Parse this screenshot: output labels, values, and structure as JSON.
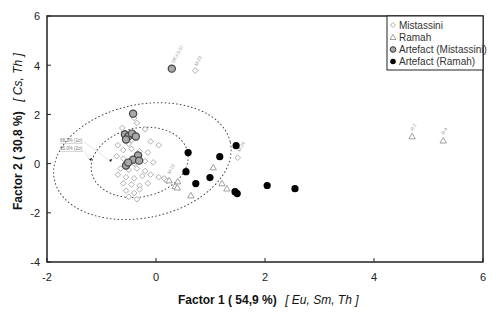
{
  "chart_data": {
    "type": "scatter",
    "title": "",
    "xlabel": "Factor 1 ( 54,9 %)",
    "xlabel_elements": "[ Eu, Sm, Th ]",
    "ylabel": "Factor 2 ( 30,8 %)",
    "ylabel_elements": "[ Cs, Th ]",
    "xlim": [
      -2,
      6
    ],
    "ylim": [
      -4,
      6
    ],
    "xticks": [
      -2,
      0,
      2,
      4,
      6
    ],
    "yticks": [
      -4,
      -2,
      0,
      2,
      4,
      6
    ],
    "grid": false,
    "legend_position": "top-right",
    "series": [
      {
        "name": "Mistassini",
        "marker": "diamond-open",
        "color": "#9a9a9a",
        "points": [
          [
            0.72,
            3.78
          ],
          [
            1.5,
            0.24
          ],
          [
            -0.4,
            1.85
          ],
          [
            -0.35,
            1.65
          ],
          [
            -0.62,
            1.45
          ],
          [
            -0.2,
            1.4
          ],
          [
            -0.45,
            0.95
          ],
          [
            -0.7,
            0.75
          ],
          [
            -0.5,
            0.8
          ],
          [
            -0.1,
            0.9
          ],
          [
            0.05,
            0.75
          ],
          [
            -0.6,
            0.55
          ],
          [
            -0.45,
            0.6
          ],
          [
            -0.3,
            0.5
          ],
          [
            -0.15,
            0.45
          ],
          [
            -0.72,
            0.3
          ],
          [
            -0.6,
            0.2
          ],
          [
            -0.4,
            0.0
          ],
          [
            -0.2,
            0.1
          ],
          [
            -0.05,
            0.05
          ],
          [
            -0.65,
            -0.2
          ],
          [
            -0.5,
            -0.25
          ],
          [
            -0.35,
            -0.2
          ],
          [
            -0.2,
            -0.3
          ],
          [
            -0.7,
            -0.45
          ],
          [
            -0.55,
            -0.55
          ],
          [
            -0.4,
            -0.6
          ],
          [
            -0.25,
            -0.5
          ],
          [
            -0.1,
            -0.45
          ],
          [
            0.05,
            -0.55
          ],
          [
            -0.6,
            -0.8
          ],
          [
            -0.45,
            -0.85
          ],
          [
            -0.3,
            -0.9
          ],
          [
            -0.15,
            -0.8
          ],
          [
            -0.55,
            -1.1
          ],
          [
            -0.4,
            -1.2
          ],
          [
            -0.3,
            -1.05
          ],
          [
            -0.5,
            -1.35
          ],
          [
            -0.35,
            -1.45
          ],
          [
            0.15,
            -0.6
          ],
          [
            0.2,
            -0.7
          ]
        ]
      },
      {
        "name": "Ramah",
        "marker": "triangle-open",
        "color": "#8a8a8a",
        "points": [
          [
            1.05,
            -0.16
          ],
          [
            0.24,
            -0.69
          ],
          [
            0.4,
            -0.73
          ],
          [
            0.35,
            -0.93
          ],
          [
            0.39,
            -0.98
          ],
          [
            0.64,
            -1.3
          ],
          [
            1.21,
            -0.81
          ],
          [
            1.3,
            -1.02
          ],
          [
            4.7,
            1.1
          ],
          [
            5.27,
            0.93
          ]
        ]
      },
      {
        "name": "Artefact (Mistassini)",
        "marker": "circle-filled-grey",
        "color": "#a8a8a8",
        "edge": "#444444",
        "points": [
          [
            0.29,
            3.86
          ],
          [
            -0.42,
            2.03
          ],
          [
            -0.57,
            1.18
          ],
          [
            -0.51,
            1.1
          ],
          [
            -0.44,
            1.22
          ],
          [
            -0.37,
            1.1
          ],
          [
            -0.55,
            0.98
          ],
          [
            -0.33,
            0.33
          ],
          [
            -0.42,
            0.16
          ],
          [
            -0.31,
            0.12
          ],
          [
            -0.55,
            -0.08
          ],
          [
            -0.51,
            0.04
          ]
        ]
      },
      {
        "name": "Artefact (Ramah)",
        "marker": "circle-filled-black",
        "color": "#000000",
        "points": [
          [
            0.59,
            0.45
          ],
          [
            0.55,
            -0.33
          ],
          [
            0.73,
            -0.81
          ],
          [
            0.99,
            -0.57
          ],
          [
            1.17,
            0.28
          ],
          [
            1.47,
            0.73
          ],
          [
            1.45,
            -1.14
          ],
          [
            1.49,
            -1.22
          ],
          [
            2.04,
            -0.89
          ],
          [
            2.55,
            -1.02
          ]
        ]
      }
    ],
    "ellipses": [
      {
        "label": "68.3% (1σ)",
        "cx": -0.3,
        "cy": 0.05,
        "rx": 0.9,
        "ry": 1.4,
        "style": "dotted"
      },
      {
        "label": "95.0% (2σ)",
        "cx": -0.25,
        "cy": 0.1,
        "rx": 1.65,
        "ry": 2.3,
        "style": "dotted"
      }
    ],
    "annotations": [
      {
        "text": "68.3% (1σ)"
      },
      {
        "text": "95.0% (2σ)"
      }
    ]
  },
  "legend": {
    "items": [
      {
        "label": "Mistassini",
        "symbol": "diamond-icon"
      },
      {
        "label": "Ramah",
        "symbol": "triangle-icon"
      },
      {
        "label": "Artefact (Mistassini)",
        "symbol": "grey-circle-icon"
      },
      {
        "label": "Artefact (Ramah)",
        "symbol": "black-circle-icon"
      }
    ]
  },
  "axes": {
    "x_title": "Factor 1 ( 54,9 %)",
    "x_title_elements": "[ Eu, Sm, Th ]",
    "y_title": "Factor 2 ( 30,8 %)",
    "y_title_elements": "[ Cs, Th ]",
    "x_ticks": [
      "-2",
      "0",
      "2",
      "4",
      "6"
    ],
    "y_ticks": [
      "6",
      "4",
      "2",
      "0",
      "-2",
      "-4"
    ]
  },
  "annotations": {
    "sigma1": "68.3% (1σ)",
    "sigma2": "95.0% (2σ)"
  }
}
